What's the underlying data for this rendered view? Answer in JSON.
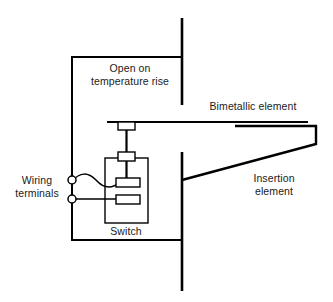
{
  "diagram": {
    "background_color": "#ffffff",
    "line_color": "#000000",
    "text_color": "#1a1a1a",
    "labels": {
      "open_on_temperature_rise": "Open on\ntemperature rise",
      "bimetallic_element": "Bimetallic element",
      "insertion_element": "Insertion\nelement",
      "wiring_terminals": "Wiring\nterminals",
      "switch": "Switch"
    },
    "parts": {
      "duct_wall_upper": "duct-wall-upper",
      "duct_wall_lower": "duct-wall-lower",
      "circuit_wire": "circuit-wire-loop",
      "terminal_upper": "wiring-terminal-upper",
      "terminal_lower": "wiring-terminal-lower",
      "flexible_lead": "flexible-wavy-lead",
      "switch_body": "switch-enclosure",
      "contact_top": "actuator-contact-pad",
      "contact_moving": "moving-contact-pad",
      "contact_fixed": "fixed-contact-pad",
      "bimetal_bar": "bimetallic-bar",
      "bimetal_pad": "bimetallic-contact-pad",
      "insertion_wedge": "insertion-element-wedge",
      "actuator_stem_upper": "actuator-stem-upper",
      "actuator_stem_lower": "actuator-stem-lower"
    }
  }
}
